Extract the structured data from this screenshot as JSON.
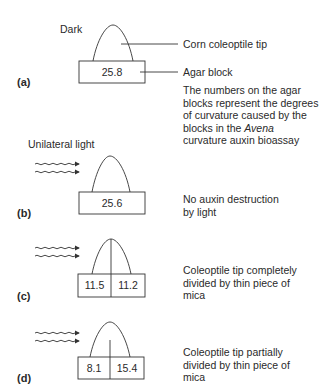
{
  "figure": {
    "panels": [
      {
        "id": "a",
        "label": "(a)",
        "condition": "Dark",
        "block_values": [
          "25.8"
        ],
        "divider": "none",
        "callouts": {
          "tip": "Corn coleoptile tip",
          "block": "Agar block"
        },
        "description_lines": [
          "The numbers on the agar",
          "blocks represent the degrees",
          "of curvature caused by the",
          "blocks in the ",
          "Avena",
          "curvature auxin bioassay"
        ]
      },
      {
        "id": "b",
        "label": "(b)",
        "condition": "Unilateral light",
        "block_values": [
          "25.6"
        ],
        "divider": "none",
        "description_lines": [
          "No auxin destruction",
          "by light"
        ]
      },
      {
        "id": "c",
        "label": "(c)",
        "block_values": [
          "11.5",
          "11.2"
        ],
        "divider": "complete",
        "description_lines": [
          "Coleoptile tip completely",
          "divided by thin piece of",
          "mica"
        ]
      },
      {
        "id": "d",
        "label": "(d)",
        "block_values": [
          "8.1",
          "15.4"
        ],
        "divider": "partial",
        "description_lines": [
          "Coleoptile tip partially",
          "divided by thin piece of",
          "mica"
        ]
      }
    ],
    "icons": {
      "light": "wavy-arrow-icon"
    },
    "colors": {
      "line": "#333333",
      "text": "#2a2a2a",
      "background": "#ffffff"
    }
  }
}
